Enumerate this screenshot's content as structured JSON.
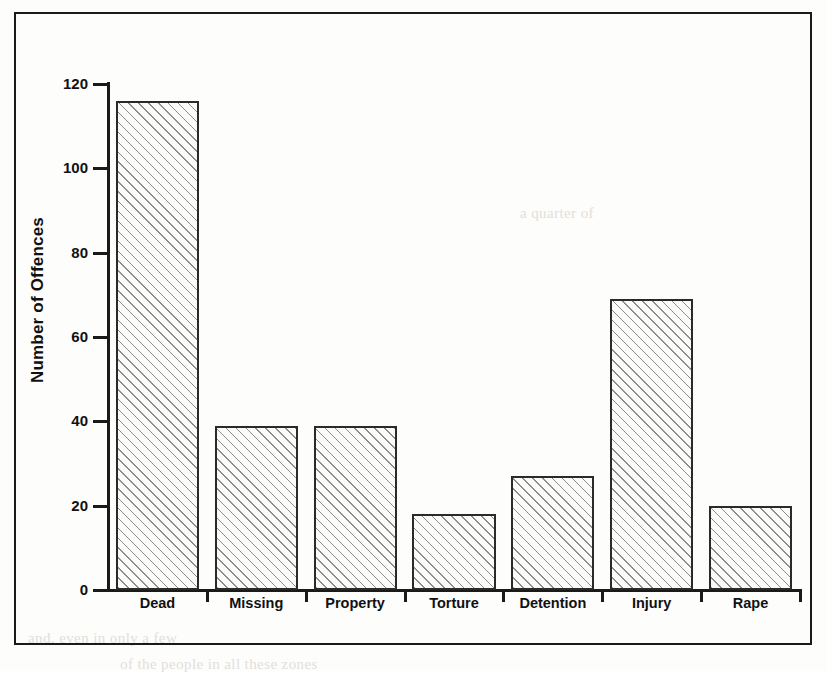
{
  "chart_data": {
    "type": "bar",
    "title": "",
    "xlabel": "",
    "ylabel": "Number of Offences",
    "categories": [
      "Dead",
      "Missing",
      "Property",
      "Torture",
      "Detention",
      "Injury",
      "Rape"
    ],
    "values": [
      116,
      39,
      39,
      18,
      27,
      69,
      20
    ],
    "ylim": [
      0,
      120
    ],
    "ytick_labels": [
      "0",
      "20",
      "40",
      "60",
      "80",
      "100",
      "120"
    ],
    "ytick_values": [
      0,
      20,
      40,
      60,
      80,
      100,
      120
    ],
    "grid": false,
    "legend": null,
    "bar_style": {
      "fill": "diagonal-hatch",
      "edge_color": "#2a2a2a",
      "face_color": "#fbfbfa"
    }
  },
  "figure": {
    "frame_color": "#1a1a1a",
    "background_color": "#fdfdfc"
  },
  "ghost_text": {
    "line_right_top": "a quarter of",
    "line_left_bottom": "and, even in only a few",
    "line_bottom": "of the people in all these zones"
  }
}
